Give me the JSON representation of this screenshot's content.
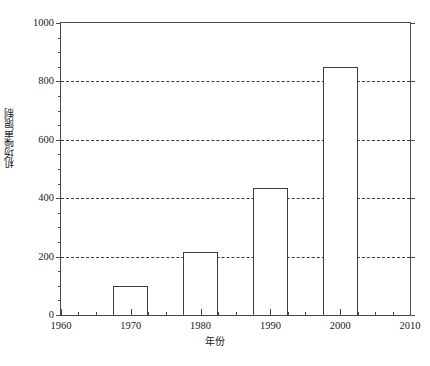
{
  "chart_data": {
    "type": "bar",
    "title": "",
    "xlabel": "年份",
    "ylabel": "机场噪声限制",
    "categories": [
      "1970",
      "1980",
      "1990",
      "2000"
    ],
    "values": [
      100,
      215,
      435,
      850
    ],
    "x": [
      1970,
      1980,
      1990,
      2000
    ],
    "xlim": [
      1960,
      2010
    ],
    "ylim": [
      0,
      1000
    ],
    "xticks": [
      "1960",
      "1970",
      "1980",
      "1990",
      "2000",
      "2010"
    ],
    "xtick_values": [
      1960,
      1970,
      1980,
      1990,
      2000,
      2010
    ],
    "x_minor_interval": 2.5,
    "yticks": [
      "0",
      "200",
      "400",
      "600",
      "800",
      "1000"
    ],
    "ytick_values": [
      0,
      200,
      400,
      600,
      800,
      1000
    ],
    "y_minor_interval": 50,
    "gridlines": [
      200,
      400,
      600,
      800
    ],
    "grid": "horizontal-dashed",
    "legend": "none",
    "bar_width_years": 5,
    "bar_fill": "#ffffff",
    "bar_edge": "#3f3f3f",
    "axis_color": "#4a4a4a",
    "grid_color": "#3c3c3c",
    "background": "#ffffff"
  },
  "caption": {
    "text": ""
  }
}
